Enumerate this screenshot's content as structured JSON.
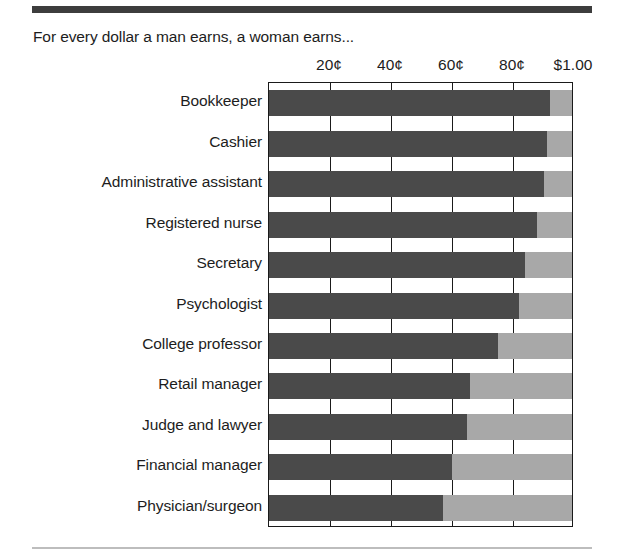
{
  "caption": "For every dollar a man earns, a woman earns...",
  "rules": {
    "top_color": "#3d3d3d",
    "bottom_color": "#bdbdbd"
  },
  "chart_data": {
    "type": "bar",
    "orientation": "horizontal",
    "title": "For every dollar a man earns, a woman earns...",
    "xlabel": "",
    "ylabel": "",
    "xlim": [
      0,
      100
    ],
    "grid": true,
    "legend": "none",
    "axis_position": "top",
    "unit": "cents per dollar earned by a man",
    "tick_values": [
      20,
      40,
      60,
      80,
      100
    ],
    "tick_labels": [
      "20¢",
      "40¢",
      "60¢",
      "80¢",
      "$1.00"
    ],
    "categories": [
      "Bookkeeper",
      "Cashier",
      "Administrative assistant",
      "Registered nurse",
      "Secretary",
      "Psychologist",
      "College professor",
      "Retail manager",
      "Judge and lawyer",
      "Financial manager",
      "Physician/surgeon"
    ],
    "values": [
      92,
      91,
      90,
      88,
      84,
      82,
      75,
      66,
      65,
      60,
      57
    ],
    "remainder_values": [
      8,
      9,
      10,
      12,
      16,
      18,
      25,
      34,
      35,
      40,
      43
    ],
    "series": [
      {
        "name": "Woman's earnings",
        "color": "#4a4a4a",
        "values": [
          92,
          91,
          90,
          88,
          84,
          82,
          75,
          66,
          65,
          60,
          57
        ]
      },
      {
        "name": "Gap to one dollar",
        "color": "#a8a8a8",
        "values": [
          8,
          9,
          10,
          12,
          16,
          18,
          25,
          34,
          35,
          40,
          43
        ]
      }
    ]
  }
}
